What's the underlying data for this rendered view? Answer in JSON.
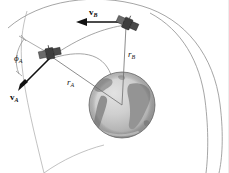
{
  "figure": {
    "background_color": "#ffffff",
    "width": 229,
    "height": 173
  },
  "labels": {
    "velocity_a": "v",
    "velocity_a_sub": "A",
    "velocity_b": "v",
    "velocity_b_sub": "B",
    "radius_a": "r",
    "radius_a_sub": "A",
    "radius_b": "r",
    "radius_b_sub": "B",
    "flight_path_angle": "ϕ",
    "flight_path_angle_sub": "A"
  },
  "elements": {
    "earth_name": "earth-globe",
    "satellite_a_name": "satellite-a",
    "satellite_b_name": "satellite-b",
    "inner_orbit_name": "inner-orbit-arc",
    "outer_orbit_name": "outer-orbit-arc",
    "transfer_orbit_name": "transfer-orbit-arc"
  },
  "colors": {
    "ocean": "#c9c9c9",
    "ocean_light": "#d8d8d8",
    "land": "#9a9a9a",
    "land_dark": "#878787",
    "orbit_stroke": "#8e8e8e",
    "radius_stroke": "#6f6f6f",
    "vector_stroke": "#111111",
    "satellite_body": "#3d3d3d",
    "label_text": "#1a1a1a",
    "background": "#ffffff"
  },
  "geometry": {
    "earth_center_x": 122,
    "earth_center_y": 105,
    "earth_radius": 33,
    "satellite_a_x": 50,
    "satellite_a_y": 54,
    "satellite_b_x": 126,
    "satellite_b_y": 24
  }
}
